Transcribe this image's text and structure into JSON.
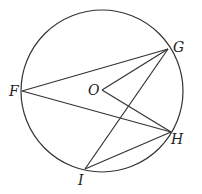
{
  "diagram": {
    "stroke_color": "#333333",
    "circle": {
      "label": "O",
      "cx": 102,
      "cy": 91,
      "r": 81
    },
    "points": {
      "O": {
        "label": "O",
        "x": 102,
        "y": 90
      },
      "F": {
        "label": "F",
        "x": 22,
        "y": 91
      },
      "G": {
        "label": "G",
        "x": 168,
        "y": 49
      },
      "H": {
        "label": "H",
        "x": 171,
        "y": 132
      },
      "I": {
        "label": "I",
        "x": 85,
        "y": 169
      }
    },
    "segments": [
      [
        "F",
        "G"
      ],
      [
        "F",
        "H"
      ],
      [
        "O",
        "G"
      ],
      [
        "O",
        "H"
      ],
      [
        "I",
        "G"
      ],
      [
        "I",
        "H"
      ]
    ]
  }
}
